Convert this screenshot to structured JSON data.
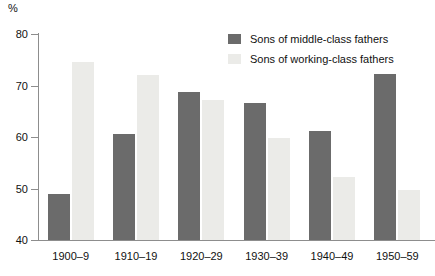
{
  "chart_data": {
    "type": "bar",
    "title": "",
    "subtitle": "",
    "xlabel": "",
    "ylabel": "%",
    "ylim": [
      40,
      80
    ],
    "yticks": [
      40,
      50,
      60,
      70,
      80
    ],
    "ytick_labels": [
      "40",
      "50",
      "60",
      "70",
      "80"
    ],
    "grid": false,
    "legend_position": "top-center-right",
    "categories": [
      "1900–9",
      "1910–19",
      "1920–29",
      "1930–39",
      "1940–49",
      "1950–59"
    ],
    "series": [
      {
        "name": "Sons of middle-class fathers",
        "color": "#6b6b6b",
        "values": [
          49.0,
          60.5,
          68.8,
          66.6,
          61.2,
          72.3
        ]
      },
      {
        "name": "Sons of working-class fathers",
        "color": "#ebebe8",
        "values": [
          74.5,
          72.0,
          67.2,
          59.8,
          52.2,
          49.8
        ]
      }
    ]
  },
  "axis": {
    "unit_label": "%",
    "axis_color": "#8d8d8d"
  },
  "legend": {
    "items": [
      {
        "label": "Sons of middle-class fathers",
        "color": "#6b6b6b"
      },
      {
        "label": "Sons of working-class fathers",
        "color": "#ebebe8"
      }
    ]
  }
}
